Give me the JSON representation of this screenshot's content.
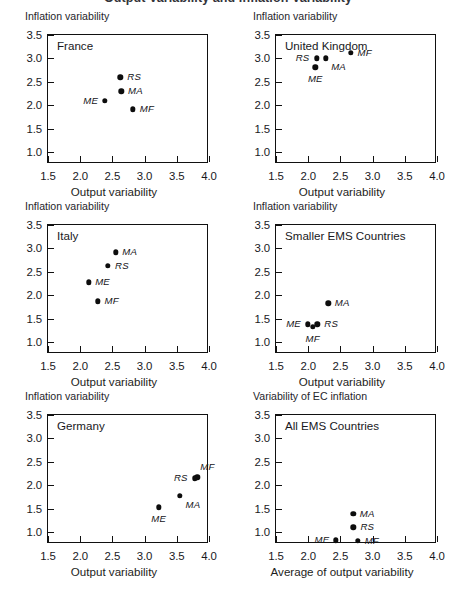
{
  "figure": {
    "clipped_top_title": "Output Variability and Inflation Variability",
    "axis_titles": {
      "y_default": "Inflation variability",
      "y_last": "Variability of EC inflation",
      "x_default": "Output variability",
      "x_last": "Average of output variability"
    },
    "xticks": [
      "1.5",
      "2.0",
      "2.5",
      "3.0",
      "3.5",
      "4.0"
    ],
    "yticks": [
      "1.0",
      "1.5",
      "2.0",
      "2.5",
      "3.0",
      "3.5"
    ],
    "xlim": [
      1.5,
      4.0
    ],
    "ylim": [
      0.75,
      3.5
    ]
  },
  "chart_data": [
    {
      "type": "scatter",
      "title": "France",
      "xlabel": "Output variability",
      "ylabel": "Inflation variability",
      "xlim": [
        1.5,
        4.0
      ],
      "ylim": [
        0.75,
        3.5
      ],
      "xticks": [
        1.5,
        2.0,
        2.5,
        3.0,
        3.5,
        4.0
      ],
      "yticks": [
        1.0,
        1.5,
        2.0,
        2.5,
        3.0,
        3.5
      ],
      "grid": false,
      "legend": "none",
      "points": [
        {
          "label": "RS",
          "x": 2.62,
          "y": 2.6,
          "label_pos": "right"
        },
        {
          "label": "MA",
          "x": 2.64,
          "y": 2.3,
          "label_pos": "right"
        },
        {
          "label": "ME",
          "x": 2.38,
          "y": 2.1,
          "label_pos": "left"
        },
        {
          "label": "MF",
          "x": 2.82,
          "y": 1.92,
          "label_pos": "right"
        }
      ]
    },
    {
      "type": "scatter",
      "title": "United Kingdom",
      "xlabel": "Output variability",
      "ylabel": "Inflation variability",
      "xlim": [
        1.5,
        4.0
      ],
      "ylim": [
        0.75,
        3.5
      ],
      "xticks": [
        1.5,
        2.0,
        2.5,
        3.0,
        3.5,
        4.0
      ],
      "yticks": [
        1.0,
        1.5,
        2.0,
        2.5,
        3.0,
        3.5
      ],
      "grid": false,
      "legend": "none",
      "points": [
        {
          "label": "RS",
          "x": 2.13,
          "y": 3.0,
          "label_pos": "left"
        },
        {
          "label": "MA",
          "x": 2.27,
          "y": 3.0,
          "label_pos": "belowright"
        },
        {
          "label": "MF",
          "x": 2.66,
          "y": 3.12,
          "label_pos": "right"
        },
        {
          "label": "ME",
          "x": 2.11,
          "y": 2.81,
          "label_pos": "below"
        }
      ]
    },
    {
      "type": "scatter",
      "title": "Italy",
      "xlabel": "Output variability",
      "ylabel": "Inflation variability",
      "xlim": [
        1.5,
        4.0
      ],
      "ylim": [
        0.75,
        3.5
      ],
      "xticks": [
        1.5,
        2.0,
        2.5,
        3.0,
        3.5,
        4.0
      ],
      "yticks": [
        1.0,
        1.5,
        2.0,
        2.5,
        3.0,
        3.5
      ],
      "grid": false,
      "legend": "none",
      "points": [
        {
          "label": "MA",
          "x": 2.55,
          "y": 2.92,
          "label_pos": "right"
        },
        {
          "label": "RS",
          "x": 2.43,
          "y": 2.63,
          "label_pos": "right"
        },
        {
          "label": "ME",
          "x": 2.13,
          "y": 2.28,
          "label_pos": "right"
        },
        {
          "label": "MF",
          "x": 2.27,
          "y": 1.87,
          "label_pos": "right"
        }
      ]
    },
    {
      "type": "scatter",
      "title": "Smaller EMS Countries",
      "xlabel": "Output variability",
      "ylabel": "Inflation variability",
      "xlim": [
        1.5,
        4.0
      ],
      "ylim": [
        0.75,
        3.5
      ],
      "xticks": [
        1.5,
        2.0,
        2.5,
        3.0,
        3.5,
        4.0
      ],
      "yticks": [
        1.0,
        1.5,
        2.0,
        2.5,
        3.0,
        3.5
      ],
      "grid": false,
      "legend": "none",
      "points": [
        {
          "label": "MA",
          "x": 2.31,
          "y": 1.83,
          "label_pos": "right"
        },
        {
          "label": "ME",
          "x": 1.99,
          "y": 1.38,
          "label_pos": "left"
        },
        {
          "label": "MF",
          "x": 2.07,
          "y": 1.33,
          "label_pos": "below"
        },
        {
          "label": "RS",
          "x": 2.14,
          "y": 1.38,
          "label_pos": "right"
        }
      ]
    },
    {
      "type": "scatter",
      "title": "Germany",
      "xlabel": "Output variability",
      "ylabel": "Inflation variability",
      "xlim": [
        1.5,
        4.0
      ],
      "ylim": [
        0.75,
        3.5
      ],
      "xticks": [
        1.5,
        2.0,
        2.5,
        3.0,
        3.5,
        4.0
      ],
      "yticks": [
        1.0,
        1.5,
        2.0,
        2.5,
        3.0,
        3.5
      ],
      "grid": false,
      "legend": "none",
      "points": [
        {
          "label": "MF",
          "x": 3.82,
          "y": 2.17,
          "label_pos": "aboveright"
        },
        {
          "label": "RS",
          "x": 3.78,
          "y": 2.15,
          "label_pos": "left"
        },
        {
          "label": "MA",
          "x": 3.55,
          "y": 1.78,
          "label_pos": "belowright"
        },
        {
          "label": "ME",
          "x": 3.22,
          "y": 1.53,
          "label_pos": "below"
        }
      ]
    },
    {
      "type": "scatter",
      "title": "All EMS Countries",
      "xlabel": "Average of output variability",
      "ylabel": "Variability of EC inflation",
      "xlim": [
        1.5,
        4.0
      ],
      "ylim": [
        0.75,
        3.5
      ],
      "xticks": [
        1.5,
        2.0,
        2.5,
        3.0,
        3.5,
        4.0
      ],
      "yticks": [
        1.0,
        1.5,
        2.0,
        2.5,
        3.0,
        3.5
      ],
      "grid": false,
      "legend": "none",
      "points": [
        {
          "label": "MA",
          "x": 2.7,
          "y": 1.39,
          "label_pos": "right"
        },
        {
          "label": "RS",
          "x": 2.7,
          "y": 1.11,
          "label_pos": "right"
        },
        {
          "label": "ME",
          "x": 2.43,
          "y": 0.83,
          "label_pos": "left"
        },
        {
          "label": "MF",
          "x": 2.77,
          "y": 0.82,
          "label_pos": "right"
        }
      ]
    }
  ]
}
